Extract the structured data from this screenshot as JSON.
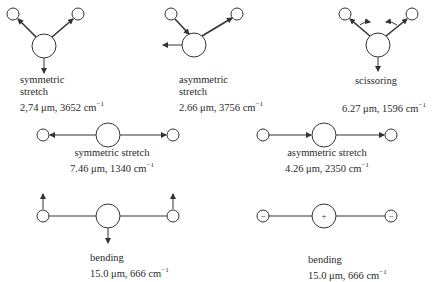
{
  "modes": [
    {
      "molecule": "H2O",
      "name_line1": "symmetric",
      "name_line2": "stretch",
      "wavelength": "2,74 μm",
      "wavenumber": "3652 cm",
      "unit_sup": "−1"
    },
    {
      "molecule": "H2O",
      "name_line1": "asymmetric",
      "name_line2": "stretch",
      "wavelength": "2.66 μm",
      "wavenumber": "3756 cm",
      "unit_sup": "−1"
    },
    {
      "molecule": "H2O",
      "name_line1": "scissoring",
      "wavelength": "6.27 μm",
      "wavenumber": "1596 cm",
      "unit_sup": "−1"
    },
    {
      "molecule": "CO2",
      "name_line1": "symmetric stretch",
      "wavelength": "7.46 μm",
      "wavenumber": "1340 cm",
      "unit_sup": "−1"
    },
    {
      "molecule": "CO2",
      "name_line1": "asymmetric stretch",
      "wavelength": "4.26 μm",
      "wavenumber": "2350 cm",
      "unit_sup": "−1"
    },
    {
      "molecule": "CO2",
      "name_line1": "bending",
      "wavelength": "15.0 μm",
      "wavenumber": "666 cm",
      "unit_sup": "−1"
    },
    {
      "molecule": "CO2",
      "name_line1": "bending",
      "wavelength": "15.0 μm",
      "wavenumber": "666 cm",
      "unit_sup": "−1",
      "charges": {
        "outer": "−",
        "center": "+"
      }
    }
  ],
  "colors": {
    "stroke": "#333333",
    "background": "#ffffff"
  }
}
